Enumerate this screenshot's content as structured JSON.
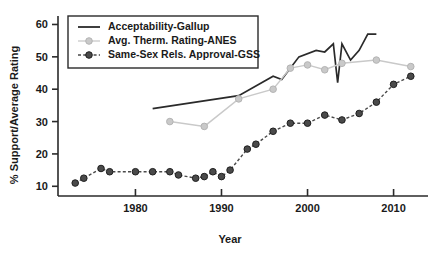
{
  "chart_data": {
    "type": "line",
    "title": "",
    "xlabel": "Year",
    "ylabel": "% Support/Average Rating",
    "xlim": [
      1971,
      2014
    ],
    "ylim": [
      7,
      62
    ],
    "grid": false,
    "legend_position": "top-left",
    "xticks": [
      1980,
      1990,
      2000,
      2010
    ],
    "yticks": [
      10,
      20,
      30,
      40,
      50,
      60
    ],
    "series": [
      {
        "name": "Acceptability-Gallup",
        "color": "#2a2a2a",
        "marker": "none",
        "linestyle": "solid",
        "x": [
          1982,
          1992,
          1996,
          1997,
          1999,
          2001,
          2002,
          2003,
          2003.5,
          2004,
          2005,
          2006,
          2007,
          2008
        ],
        "y": [
          34.0,
          38.0,
          44.0,
          43.0,
          50.0,
          52.0,
          51.5,
          54.0,
          42.0,
          54.0,
          49.0,
          52.0,
          57.0,
          57.0
        ]
      },
      {
        "name": "Avg. Therm. Rating-ANES",
        "color": "#c9c9c9",
        "marker": "circle",
        "linestyle": "solid",
        "x": [
          1984,
          1988,
          1992,
          1996,
          1998,
          2000,
          2002,
          2004,
          2008,
          2012
        ],
        "y": [
          30.0,
          28.5,
          37.0,
          40.0,
          46.5,
          47.5,
          46.0,
          48.0,
          49.0,
          47.0
        ]
      },
      {
        "name": "Same-Sex Rels. Approval-GSS",
        "color": "#4a4a4a",
        "marker": "circle",
        "linestyle": "dashed",
        "x": [
          1973,
          1974,
          1976,
          1977,
          1980,
          1982,
          1984,
          1985,
          1987,
          1988,
          1989,
          1990,
          1991,
          1993,
          1994,
          1996,
          1998,
          2000,
          2002,
          2004,
          2006,
          2008,
          2010,
          2012
        ],
        "y": [
          11.0,
          12.5,
          15.5,
          14.5,
          14.5,
          14.5,
          14.5,
          13.5,
          12.5,
          13.0,
          14.5,
          13.0,
          15.0,
          21.5,
          23.0,
          27.0,
          29.5,
          29.5,
          32.0,
          30.5,
          32.5,
          36.0,
          41.5,
          44.0
        ]
      }
    ]
  },
  "legend": {
    "items": [
      {
        "label": "Acceptability-Gallup"
      },
      {
        "label": "Avg. Therm. Rating-ANES"
      },
      {
        "label": "Same-Sex Rels. Approval-GSS"
      }
    ]
  }
}
